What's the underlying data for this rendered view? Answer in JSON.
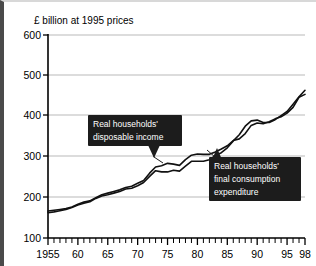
{
  "chart_data": {
    "type": "line",
    "title": "£ billion at 1995 prices",
    "xlabel": "",
    "ylabel": "£ billion at 1995 prices",
    "xlim": [
      1955,
      1998
    ],
    "ylim": [
      100,
      600
    ],
    "ytick_labels": [
      "600",
      "500",
      "400",
      "300",
      "200",
      "100"
    ],
    "ytick_values": [
      600,
      500,
      400,
      300,
      200,
      100
    ],
    "xtick_labels": [
      "1955",
      "60",
      "65",
      "70",
      "75",
      "80",
      "85",
      "90",
      "95",
      "98"
    ],
    "xtick_values": [
      1955,
      1960,
      1965,
      1970,
      1975,
      1980,
      1985,
      1990,
      1995,
      1998
    ],
    "minor_xticks": "annual",
    "grid": "horizontal",
    "legend": "none",
    "x": [
      1955,
      1956,
      1957,
      1958,
      1959,
      1960,
      1961,
      1962,
      1963,
      1964,
      1965,
      1966,
      1967,
      1968,
      1969,
      1970,
      1971,
      1972,
      1973,
      1974,
      1975,
      1976,
      1977,
      1978,
      1979,
      1980,
      1981,
      1982,
      1983,
      1984,
      1985,
      1986,
      1987,
      1988,
      1989,
      1990,
      1991,
      1992,
      1993,
      1994,
      1995,
      1996,
      1997,
      1998
    ],
    "series": [
      {
        "name": "Real households' disposable income",
        "values": [
          166,
          168,
          170,
          172,
          176,
          183,
          188,
          191,
          199,
          206,
          210,
          214,
          218,
          224,
          227,
          234,
          241,
          259,
          274,
          277,
          283,
          281,
          278,
          292,
          303,
          306,
          305,
          305,
          311,
          318,
          326,
          339,
          343,
          356,
          376,
          382,
          380,
          385,
          392,
          397,
          406,
          420,
          445,
          452
        ],
        "color": "#111111",
        "label": "Real households' disposable income"
      },
      {
        "name": "Real households' final consumption expenditure",
        "values": [
          162,
          164,
          167,
          170,
          175,
          181,
          185,
          189,
          197,
          203,
          206,
          210,
          214,
          220,
          222,
          228,
          236,
          251,
          265,
          262,
          262,
          266,
          264,
          276,
          288,
          288,
          288,
          292,
          302,
          309,
          321,
          338,
          353,
          374,
          387,
          389,
          383,
          383,
          390,
          400,
          410,
          428,
          446,
          462
        ]
      }
    ],
    "callouts": [
      {
        "id": "callout-disposable-income",
        "lines": [
          "Real households'",
          "disposable income"
        ],
        "points_to_series": "Real households' disposable income"
      },
      {
        "id": "callout-consumption-expenditure",
        "lines": [
          "Real households'",
          "final consumption",
          "expenditure"
        ],
        "points_to_series": "Real households' final consumption expenditure"
      }
    ],
    "colors": {
      "line": "#111111",
      "grid": "#b9b9b9",
      "callout_bg": "#1c1c1c",
      "callout_fg": "#ffffff",
      "background": "#ffffff"
    }
  }
}
